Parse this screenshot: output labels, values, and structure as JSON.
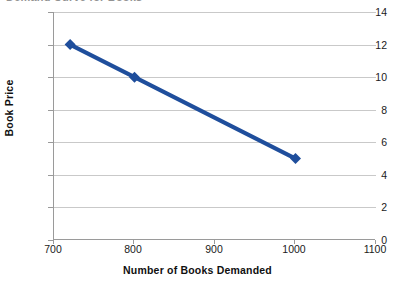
{
  "chart_data": {
    "type": "line",
    "title": "",
    "xlabel": "Number of Books Demanded",
    "ylabel": "Book Price",
    "xlim": [
      700,
      1100
    ],
    "ylim": [
      0,
      14
    ],
    "xticks": [
      700,
      800,
      900,
      1000,
      1100
    ],
    "yticks": [
      0,
      2,
      4,
      6,
      8,
      10,
      12,
      14
    ],
    "grid": "horizontal",
    "legend": "none",
    "marker": "diamond",
    "series": [
      {
        "name": "Demand",
        "color": "#1F4E9C",
        "x": [
          720,
          800,
          1000
        ],
        "y": [
          12,
          10,
          5
        ],
        "points": [
          {
            "x": 720,
            "y": 12
          },
          {
            "x": 800,
            "y": 10
          },
          {
            "x": 1000,
            "y": 5
          }
        ]
      }
    ]
  },
  "axes": {
    "y_title": "Book Price",
    "x_title": "Number of Books Demanded",
    "y_tick_labels": [
      "14",
      "12",
      "10",
      "8",
      "6",
      "4",
      "2",
      "0"
    ],
    "x_tick_labels": [
      "700",
      "800",
      "900",
      "1000",
      "1100"
    ]
  },
  "title_clipped": "Demand Curve for Books"
}
